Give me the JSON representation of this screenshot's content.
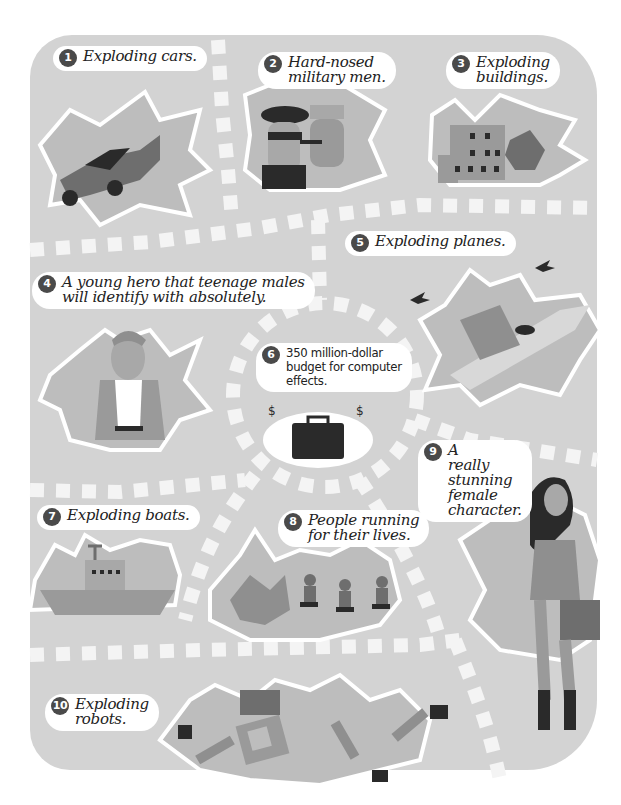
{
  "colors": {
    "board": "#d3d3d3",
    "path_tiles": "#f4f4f4",
    "burst_light": "#bdbdbd",
    "burst_dark": "#8f8f8f",
    "ink": "#2a2a2a",
    "badge": "#4a4a4a"
  },
  "items": [
    {
      "number": "1",
      "text": "Exploding cars.",
      "icon": "car-icon"
    },
    {
      "number": "2",
      "text": "Hard-nosed\nmilitary men.",
      "icon": "military-men-icon"
    },
    {
      "number": "3",
      "text": "Exploding\nbuildings.",
      "icon": "building-icon"
    },
    {
      "number": "4",
      "text": "A young hero that teenage males\nwill identify with absolutely.",
      "icon": "hero-icon"
    },
    {
      "number": "5",
      "text": "Exploding planes.",
      "icon": "plane-icon"
    },
    {
      "number": "6",
      "text": "350 million-dollar\nbudget for computer\neffects.",
      "icon": "briefcase-money-icon"
    },
    {
      "number": "7",
      "text": "Exploding boats.",
      "icon": "boat-icon"
    },
    {
      "number": "8",
      "text": "People running\nfor their lives.",
      "icon": "running-people-icon"
    },
    {
      "number": "9",
      "text": "A\nreally\nstunning\nfemale\ncharacter.",
      "icon": "female-character-icon"
    },
    {
      "number": "10",
      "text": "Exploding\nrobots.",
      "icon": "robot-icon"
    }
  ]
}
